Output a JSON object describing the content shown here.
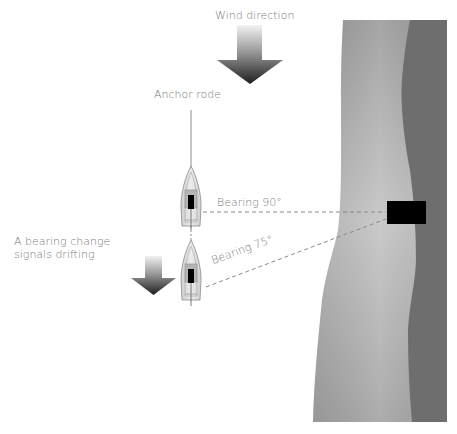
{
  "diagram": {
    "labels": {
      "wind_direction": "Wind direction",
      "anchor_rode": "Anchor rode",
      "bearing_90": "Bearing 90°",
      "bearing_75": "Bearing 75°",
      "drift_note_line1": "A bearing change",
      "drift_note_line2": "signals drifting"
    },
    "elements": {
      "wind_arrow": {
        "direction": "down",
        "size": "large"
      },
      "drift_arrow": {
        "direction": "down",
        "size": "small"
      },
      "boat_original": {
        "position": "anchored",
        "bearing_deg": 90
      },
      "boat_drifted": {
        "position": "drifted",
        "bearing_deg": 75
      },
      "landmark": {
        "shape": "rectangle",
        "color": "#000000"
      },
      "shore_light": {
        "color": "#a9a9a9"
      },
      "shore_dark": {
        "color": "#6e6e6e"
      }
    },
    "colors": {
      "text": "#7a7a7a",
      "dashed_line": "#8a8a8a",
      "boat_hull": "#d8d8d8",
      "boat_outline": "#8c8c8c",
      "mast": "#000000"
    }
  }
}
